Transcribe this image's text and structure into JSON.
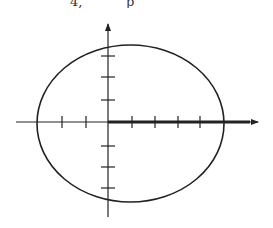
{
  "header": {
    "fragment_left": "4,",
    "fragment_right": "p"
  },
  "figure": {
    "type": "ellipse-on-axes",
    "stroke_color": "#222222",
    "background": "#ffffff",
    "ellipse": {
      "cx": 130.5,
      "cy": 123.5,
      "rx": 93.5,
      "ry": 78.5
    },
    "x_axis": {
      "y": 122,
      "x_start": 16,
      "x_end": 258,
      "bold_from": 108,
      "bold_to": 250
    },
    "y_axis": {
      "x": 108,
      "y_start": 22,
      "y_end": 217
    },
    "x_ticks": [
      62,
      86,
      132,
      155,
      178,
      200
    ],
    "y_ticks": [
      56,
      77,
      100,
      146,
      167,
      188
    ]
  }
}
